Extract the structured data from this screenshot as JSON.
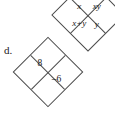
{
  "figure": {
    "label": "d.",
    "background_color": "#ffffff",
    "line_color": "#4a4a4a",
    "text_color": "#1a1a1a"
  },
  "diamond_variables": {
    "name": "variable-diamond",
    "top": "xy",
    "left": "x",
    "right": "y",
    "bottom": "x+y"
  },
  "diamond_numeric": {
    "name": "numeric-diamond",
    "top": "",
    "left": "8",
    "right": "–6",
    "bottom": ""
  }
}
